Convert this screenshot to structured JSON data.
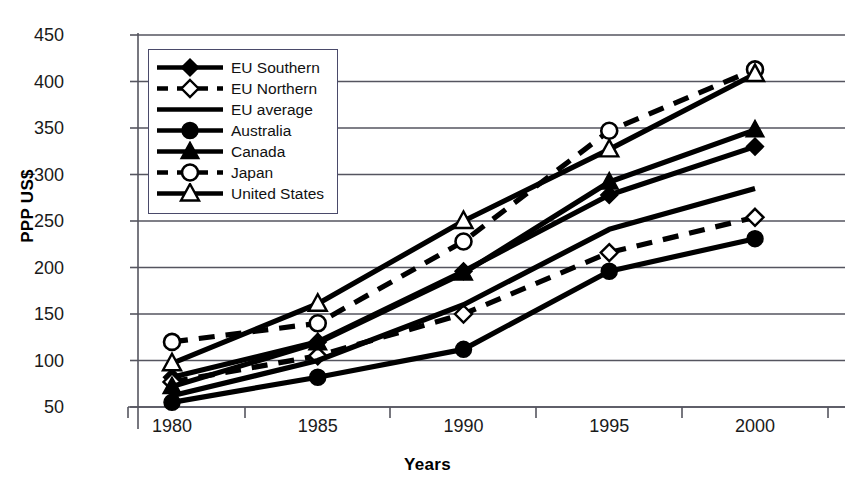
{
  "chart_data": {
    "type": "line",
    "title": "",
    "xlabel": "Years",
    "ylabel": "PPP US$",
    "x": [
      1980,
      1985,
      1990,
      1995,
      2000
    ],
    "xtick_labels": [
      "1980",
      "1985",
      "1990",
      "1995",
      "2000"
    ],
    "ytick_labels": [
      "450",
      "400",
      "350",
      "300",
      "250",
      "200",
      "150",
      "100",
      "50"
    ],
    "ylim": [
      50,
      450
    ],
    "ytick_values": [
      450,
      400,
      350,
      300,
      250,
      200,
      150,
      100,
      50
    ],
    "grid": "horizontal",
    "legend_position": "upper-left-inside",
    "series": [
      {
        "name": "EU Southern",
        "marker": "filled-diamond",
        "line": "solid",
        "values": [
          82,
          120,
          196,
          278,
          330
        ]
      },
      {
        "name": "EU Northern",
        "marker": "open-diamond",
        "line": "dashed",
        "values": [
          77,
          105,
          150,
          216,
          254
        ]
      },
      {
        "name": "EU average",
        "marker": "none",
        "line": "solid",
        "values": [
          62,
          100,
          160,
          241,
          285
        ]
      },
      {
        "name": "Australia",
        "marker": "filled-circle",
        "line": "solid",
        "values": [
          55,
          82,
          112,
          196,
          231
        ]
      },
      {
        "name": "Canada",
        "marker": "filled-triangle",
        "line": "solid",
        "values": [
          72,
          119,
          194,
          292,
          348
        ]
      },
      {
        "name": "Japan",
        "marker": "open-circle",
        "line": "dashed",
        "values": [
          120,
          140,
          228,
          347,
          413
        ]
      },
      {
        "name": "United States",
        "marker": "open-triangle",
        "line": "solid",
        "values": [
          97,
          161,
          250,
          327,
          408
        ]
      }
    ]
  },
  "legend": {
    "items": [
      {
        "label": "EU Southern"
      },
      {
        "label": "EU Northern"
      },
      {
        "label": "EU average"
      },
      {
        "label": "Australia"
      },
      {
        "label": "Canada"
      },
      {
        "label": "Japan"
      },
      {
        "label": "United States"
      }
    ]
  },
  "axes": {
    "y_title": "PPP US$",
    "x_title": "Years"
  }
}
